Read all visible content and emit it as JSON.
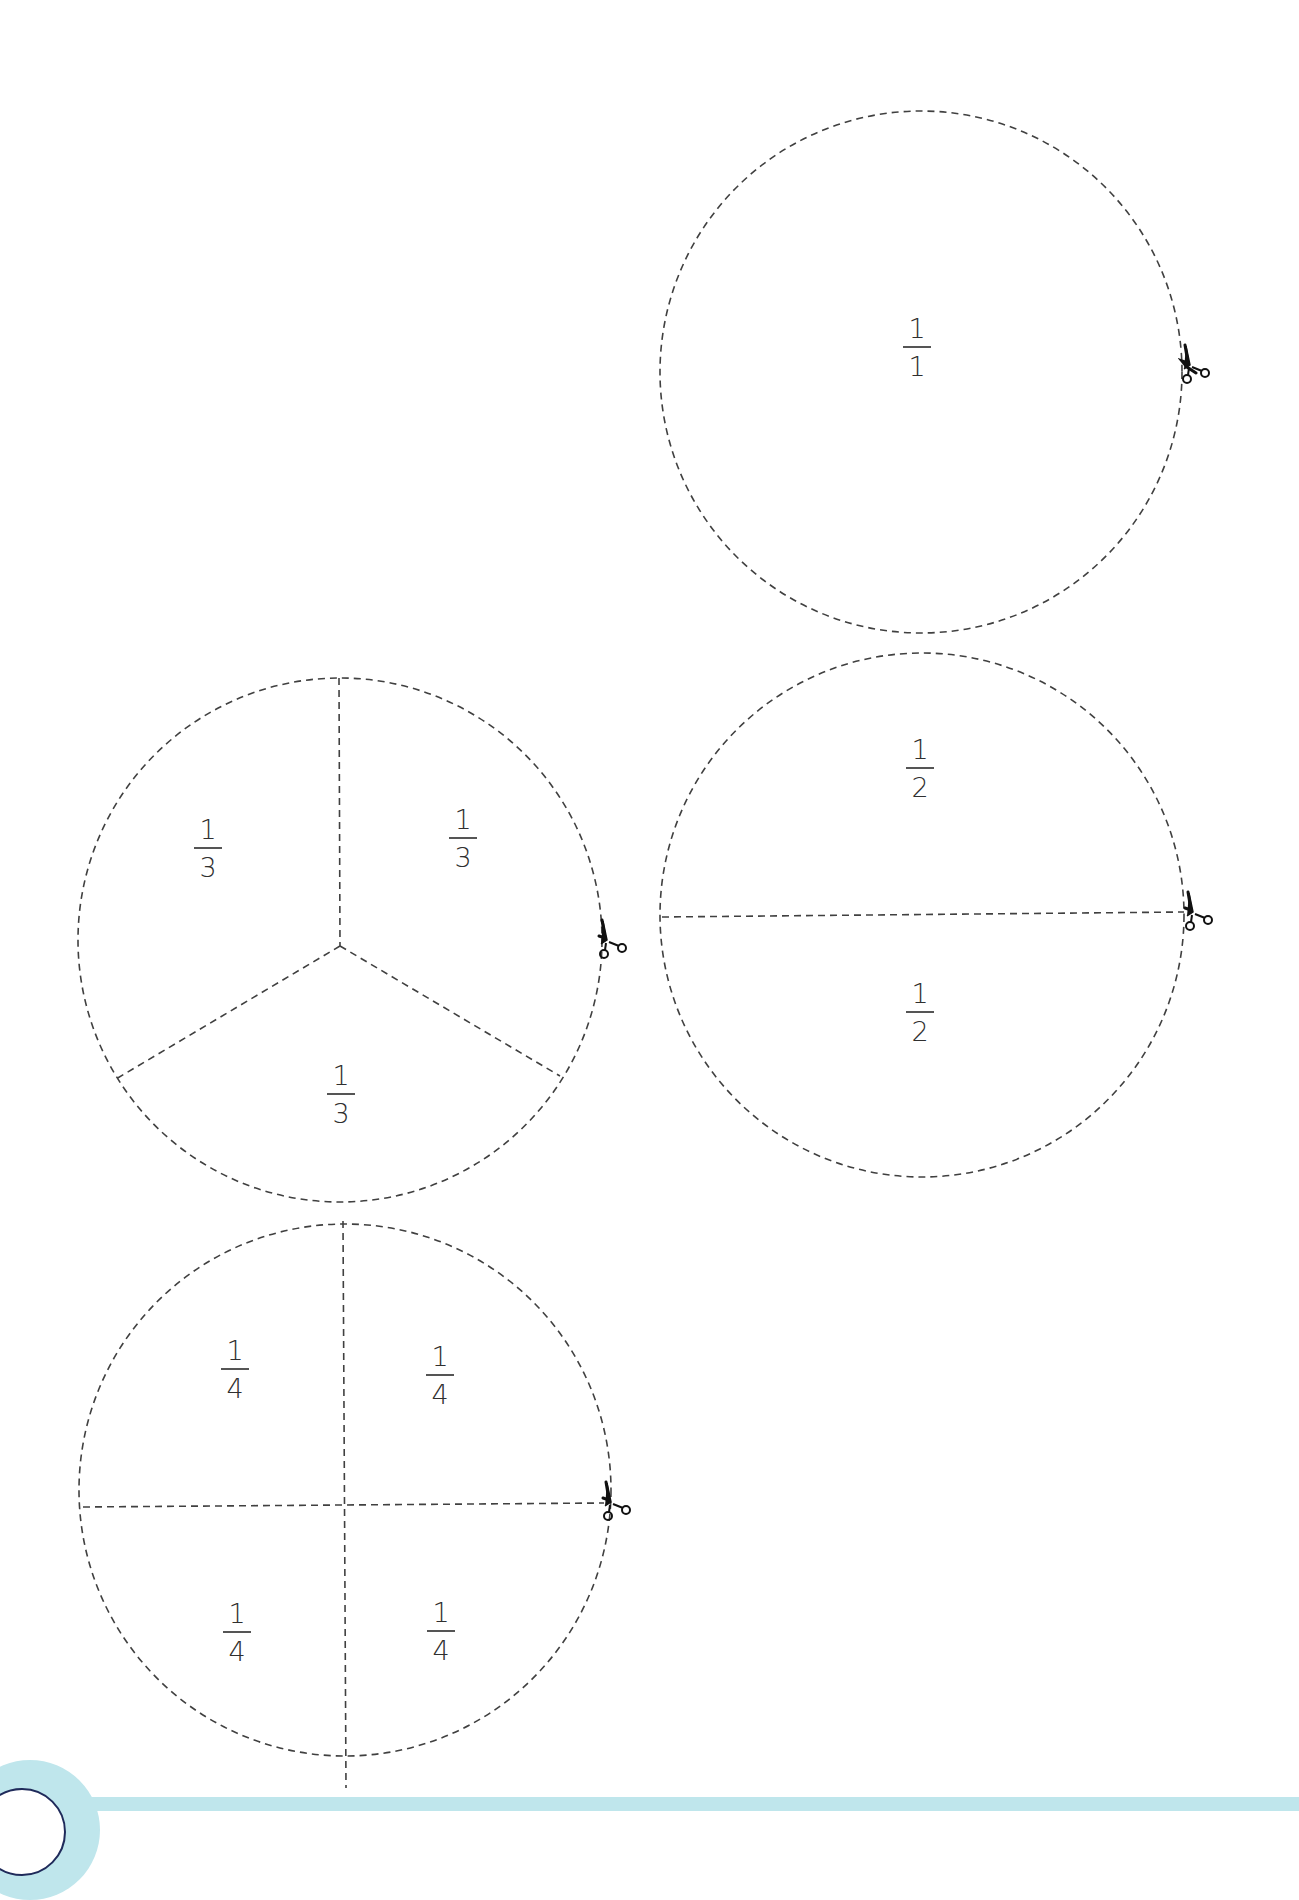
{
  "worksheet": {
    "type": "fraction-circle-cutouts",
    "line_style": "dashed-cut-line",
    "colors": {
      "line": "#404040",
      "text": "#2f2f2f",
      "footer_band": "#bfe6ec",
      "page_badge_border": "#1f2a5a"
    },
    "circles": [
      {
        "name": "whole",
        "divisions": 1,
        "fractions": [
          {
            "numerator": "1",
            "denominator": "1"
          }
        ],
        "icon": "scissors-icon"
      },
      {
        "name": "halves",
        "divisions": 2,
        "fractions": [
          {
            "numerator": "1",
            "denominator": "2"
          },
          {
            "numerator": "1",
            "denominator": "2"
          }
        ],
        "icon": "scissors-icon"
      },
      {
        "name": "thirds",
        "divisions": 3,
        "fractions": [
          {
            "numerator": "1",
            "denominator": "3"
          },
          {
            "numerator": "1",
            "denominator": "3"
          },
          {
            "numerator": "1",
            "denominator": "3"
          }
        ],
        "icon": "scissors-icon"
      },
      {
        "name": "quarters",
        "divisions": 4,
        "fractions": [
          {
            "numerator": "1",
            "denominator": "4"
          },
          {
            "numerator": "1",
            "denominator": "4"
          },
          {
            "numerator": "1",
            "denominator": "4"
          },
          {
            "numerator": "1",
            "denominator": "4"
          }
        ],
        "icon": "scissors-icon"
      }
    ]
  }
}
